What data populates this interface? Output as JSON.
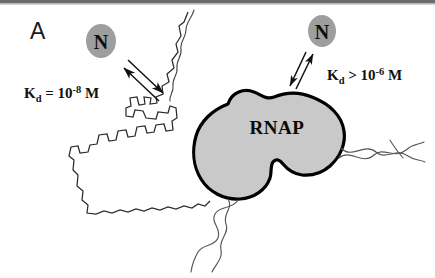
{
  "figure": {
    "panel_label": "A",
    "background_color": "#ffffff",
    "width": 435,
    "height": 278,
    "top_border_color": "#6b6b6b"
  },
  "proteins": {
    "n_left": {
      "label": "N",
      "blob_fill": "#9e9e9e",
      "cx": 101,
      "cy": 41,
      "rx": 15,
      "ry": 17
    },
    "n_right": {
      "label": "N",
      "blob_fill": "#9e9e9e",
      "cx": 322,
      "cy": 31,
      "rx": 14,
      "ry": 16
    },
    "rnap": {
      "label": "RNAP",
      "fill": "#c9c9c9",
      "stroke": "#000000",
      "stroke_width": 3.2,
      "label_x": 277,
      "label_y": 134
    }
  },
  "annotations": {
    "kd_left": {
      "symbol": "K",
      "subscript": "d",
      "relation": " = 10",
      "exponent": "-8",
      "unit": " M",
      "x": 24,
      "y": 98
    },
    "kd_right": {
      "symbol": "K",
      "subscript": "d",
      "relation": " > 10",
      "exponent": "-6",
      "unit": " M",
      "x": 327,
      "y": 80
    }
  },
  "arrows": {
    "left_equilibrium": {
      "name": "left-binding-equilibrium",
      "up_arrow": "M 159,101 L 122,66",
      "down_arrow": "M 127,60 L 164,95"
    },
    "right_equilibrium": {
      "name": "right-binding-equilibrium",
      "up_arrow": "M 297,88 L 315,52",
      "down_arrow": "M 305,50 L 289,85"
    }
  },
  "colors": {
    "ink": "#000000",
    "blob_gray": "#9e9e9e",
    "rnap_gray": "#c9c9c9",
    "dna_line": "#555555",
    "outline_line": "#2b2b2b"
  }
}
